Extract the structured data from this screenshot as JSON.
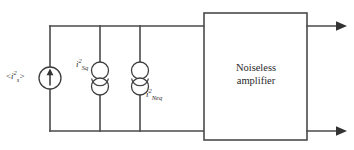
{
  "figure": {
    "type": "circuit-diagram",
    "background_color": "#ffffff",
    "line_color": "#4a4a4a",
    "text_color": "#2f2f2f"
  },
  "labels": {
    "source_noise": {
      "open_bracket": "<",
      "symbol": "i",
      "superscript": "2",
      "subscript": "s",
      "close_bracket": ">",
      "plain": "<i2s>"
    },
    "shot_noise": {
      "symbol": "i",
      "superscript": "2",
      "subscript": "Sq",
      "plain": "i2Sq"
    },
    "equivalent_noise": {
      "symbol": "i",
      "superscript": "2",
      "subscript": "Neq",
      "plain": "i2Neq"
    }
  },
  "amplifier": {
    "text": "Noiseless\namplifier",
    "line1": "Noiseless",
    "line2": "amplifier"
  },
  "elements": {
    "source_symbol": "current-source-arrow-icon",
    "noise_symbol_1": "noise-current-source-icon",
    "noise_symbol_2": "noise-current-source-icon",
    "output_arrow_top": "arrow-right-icon",
    "output_arrow_bottom": "arrow-right-icon"
  }
}
